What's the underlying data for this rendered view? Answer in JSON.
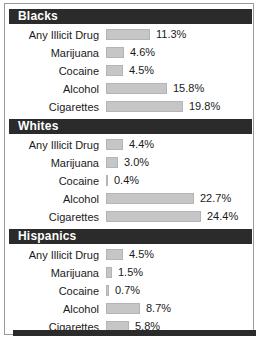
{
  "chart_data": {
    "type": "bar",
    "title": "",
    "xlabel": "",
    "ylabel": "",
    "orientation": "horizontal",
    "value_suffix": "%",
    "axis_max": 25,
    "grid": false,
    "legend": "none",
    "bar_color": "#c6c6c6",
    "header_color": "#2b2b2b",
    "categories": [
      "Any Illicit Drug",
      "Marijuana",
      "Cocaine",
      "Alcohol",
      "Cigarettes"
    ],
    "groups": [
      {
        "name": "Blacks",
        "rows": [
          {
            "label": "Any Illicit Drug",
            "value": 11.3,
            "value_label": "11.3%"
          },
          {
            "label": "Marijuana",
            "value": 4.6,
            "value_label": "4.6%"
          },
          {
            "label": "Cocaine",
            "value": 4.5,
            "value_label": "4.5%"
          },
          {
            "label": "Alcohol",
            "value": 15.8,
            "value_label": "15.8%"
          },
          {
            "label": "Cigarettes",
            "value": 19.8,
            "value_label": "19.8%"
          }
        ]
      },
      {
        "name": "Whites",
        "rows": [
          {
            "label": "Any Illicit Drug",
            "value": 4.4,
            "value_label": "4.4%"
          },
          {
            "label": "Marijuana",
            "value": 3.0,
            "value_label": "3.0%"
          },
          {
            "label": "Cocaine",
            "value": 0.4,
            "value_label": "0.4%"
          },
          {
            "label": "Alcohol",
            "value": 22.7,
            "value_label": "22.7%"
          },
          {
            "label": "Cigarettes",
            "value": 24.4,
            "value_label": "24.4%"
          }
        ]
      },
      {
        "name": "Hispanics",
        "rows": [
          {
            "label": "Any Illicit Drug",
            "value": 4.5,
            "value_label": "4.5%"
          },
          {
            "label": "Marijuana",
            "value": 1.5,
            "value_label": "1.5%"
          },
          {
            "label": "Cocaine",
            "value": 0.7,
            "value_label": "0.7%"
          },
          {
            "label": "Alcohol",
            "value": 8.7,
            "value_label": "8.7%"
          },
          {
            "label": "Cigarettes",
            "value": 5.8,
            "value_label": "5.8%"
          }
        ]
      }
    ]
  }
}
